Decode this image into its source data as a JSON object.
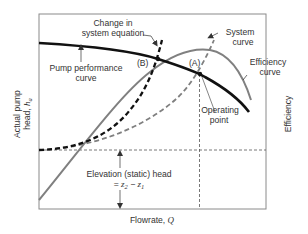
{
  "diagram": {
    "type": "pump-system-operating-point",
    "axes": {
      "x_label": "Flowrate, ",
      "x_symbol": "Q",
      "y_left_label_line1": "Actual pump",
      "y_left_label_line2": "head, ",
      "y_left_symbol": "h",
      "y_left_subscript": "a",
      "y_right_label": "Efficiency"
    },
    "annotations": {
      "change_line1": "Change in",
      "change_line2": "system equation",
      "pump_curve_line1": "Pump performance",
      "pump_curve_line2": "curve",
      "system_curve_line1": "System",
      "system_curve_line2": "curve",
      "efficiency_line1": "Efficiency",
      "efficiency_line2": "curve",
      "operating_line1": "Operating",
      "operating_line2": "point",
      "point_a": "(A)",
      "point_b": "(B)",
      "elevation_line1": "Elevation (static) head",
      "elevation_eq_prefix": "= ",
      "elevation_z2": "z",
      "elevation_sub2": "2",
      "elevation_minus": " − ",
      "elevation_z1": "z",
      "elevation_sub1": "1"
    },
    "colors": {
      "pump_curve": "#111111",
      "efficiency_curve": "#808080",
      "system_curve_original": "#808080",
      "system_curve_changed": "#111111",
      "frame": "#888888",
      "text": "#333333"
    }
  }
}
